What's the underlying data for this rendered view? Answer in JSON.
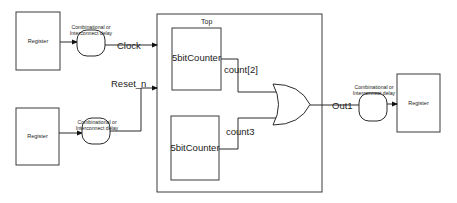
{
  "diagram": {
    "container": {
      "label": "Top"
    },
    "registers": [
      {
        "id": "reg-clock-source",
        "label": "Register"
      },
      {
        "id": "reg-reset-source",
        "label": "Register"
      },
      {
        "id": "reg-output-dest",
        "label": "Register"
      }
    ],
    "delays": [
      {
        "id": "delay-clock",
        "line1": "Combinational or",
        "line2": "Interconnect delay"
      },
      {
        "id": "delay-reset",
        "line1": "Combinational or",
        "line2": "Interconnect delay"
      },
      {
        "id": "delay-out",
        "line1": "Combinational or",
        "line2": "Interconnect delay"
      }
    ],
    "counters": [
      {
        "id": "counter-1",
        "label": "5bitCounter",
        "output": "count[2]"
      },
      {
        "id": "counter-2",
        "label": "5bitCounter",
        "output": "count3"
      }
    ],
    "signals": {
      "clock": "Clock",
      "reset": "Reset_n",
      "out": "Out1"
    },
    "gate": {
      "type": "OR"
    }
  }
}
